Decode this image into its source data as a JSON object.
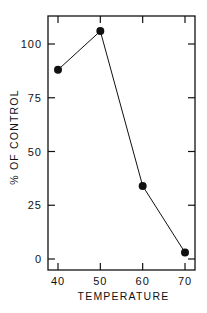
{
  "chart_data": {
    "type": "line",
    "title": "",
    "xlabel": "TEMPERATURE",
    "ylabel": "% OF CONTROL",
    "x": [
      40,
      50,
      60,
      70
    ],
    "series": [
      {
        "name": "% of control",
        "values": [
          88,
          106,
          34,
          3
        ],
        "marker": "filled-circle",
        "color": "#111111"
      }
    ],
    "xlim": [
      39.2,
      72.6
    ],
    "ylim": [
      -5,
      113
    ],
    "xticks": [
      40,
      50,
      60,
      70
    ],
    "xtick_labels": [
      "40",
      "50",
      "60",
      "70"
    ],
    "yticks": [
      0,
      25,
      50,
      75,
      100
    ],
    "ytick_labels": [
      "0",
      "25",
      "50",
      "75",
      "100"
    ],
    "grid": false,
    "legend": "none",
    "ticks_mirrored": true
  }
}
